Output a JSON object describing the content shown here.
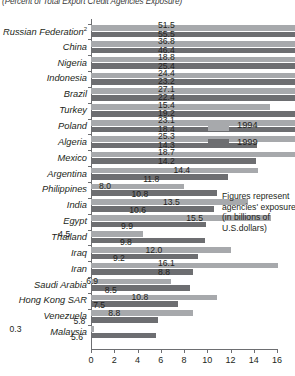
{
  "chart_data": {
    "type": "bar",
    "orientation": "horizontal",
    "title": "(Percent of Total Export Credit Agencies Exposure)",
    "xlabel": "",
    "ylabel": "",
    "xlim": [
      0,
      16
    ],
    "xticks": [
      0,
      2,
      4,
      6,
      8,
      10,
      12,
      14,
      16
    ],
    "grid": false,
    "legend_position": "upper-right",
    "categories": [
      "Russian Federation",
      "China",
      "Nigeria",
      "Indonesia",
      "Brazil",
      "Turkey",
      "Poland",
      "Algeria",
      "Mexico",
      "Argentina",
      "Philippines",
      "India",
      "Egypt",
      "Thailand",
      "Iraq",
      "Iran",
      "Saudi Arabia",
      "Hong Kong SAR",
      "Venezuela",
      "Malaysia"
    ],
    "series": [
      {
        "name": "1994",
        "color": "#a7a9ac",
        "values": [
          51.5,
          36.8,
          18.8,
          24.4,
          27.1,
          15.4,
          23.1,
          25.3,
          18.7,
          14.4,
          8.0,
          13.5,
          15.5,
          4.5,
          12.0,
          16.1,
          6.9,
          10.8,
          8.8,
          0.3
        ]
      },
      {
        "name": "1999",
        "color": "#6d6e71",
        "values": [
          55.5,
          46.4,
          25.4,
          23.2,
          22.4,
          19.2,
          18.4,
          14.3,
          14.2,
          11.8,
          10.8,
          10.6,
          9.9,
          9.8,
          9.2,
          8.8,
          8.5,
          7.5,
          5.8,
          5.6
        ]
      }
    ],
    "annotation": [
      "Figures represent",
      "agencies' exposure",
      "(in billions of",
      "U.S.dollars)"
    ],
    "notes": {
      "russian_federation_superscript": "2",
      "offscale_note": "Russian Federation and China values exceed the 0-16 axis range; bars extend beyond plot width."
    }
  }
}
